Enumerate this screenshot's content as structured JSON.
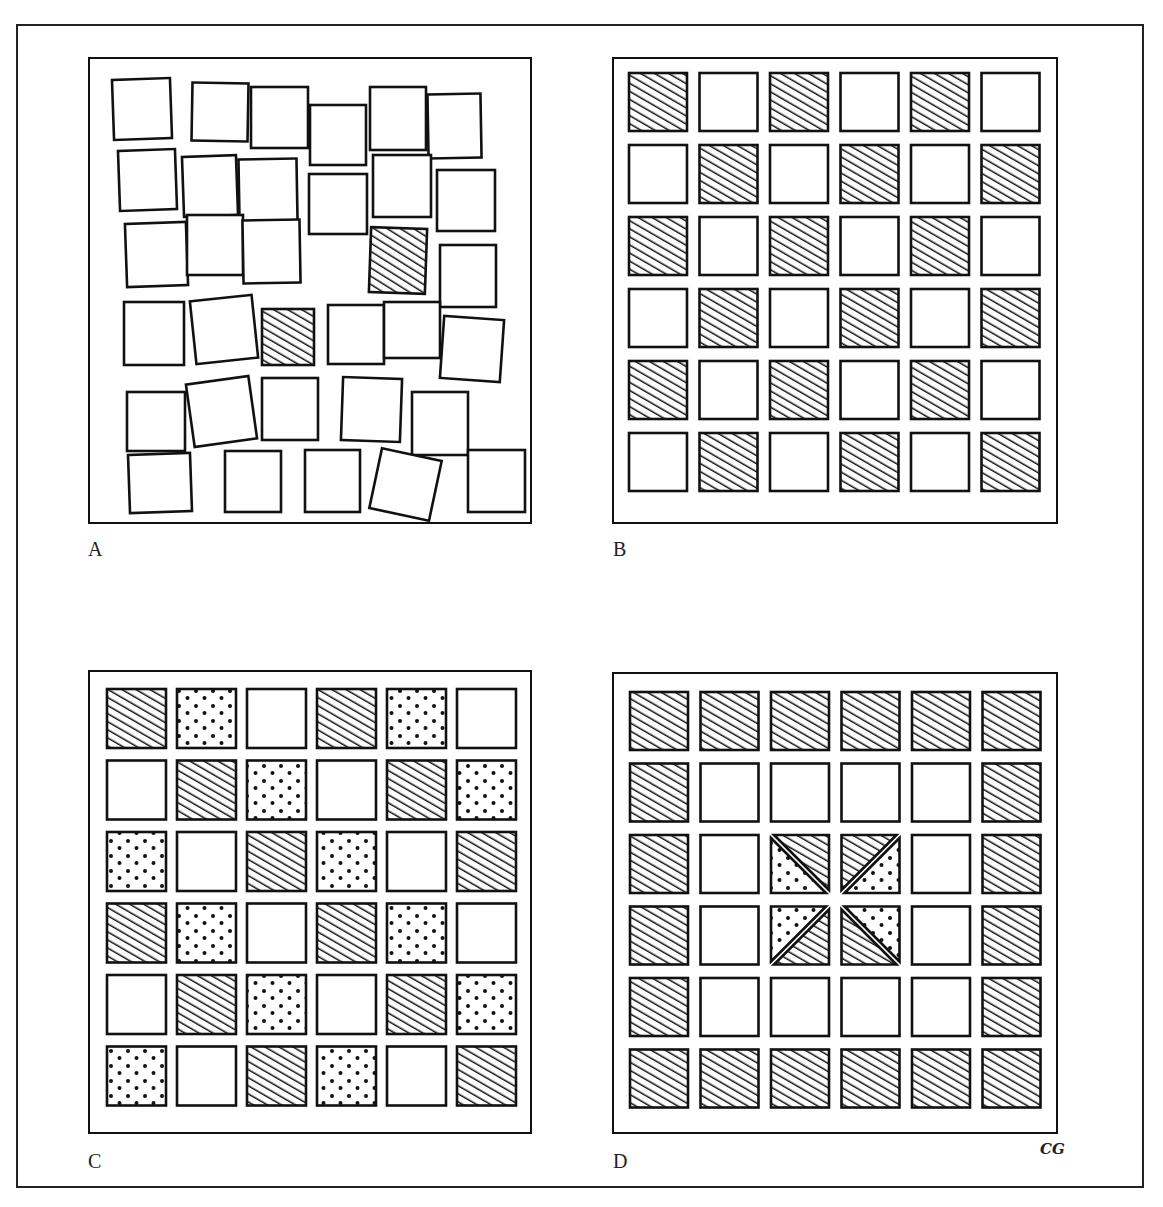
{
  "figure": {
    "panels": [
      {
        "id": "A",
        "label": "A",
        "description": "Irregular, overlapping, rotated squares; two hatched",
        "squares": [
          [
            111,
            77,
            58,
            60,
            -2,
            "plain"
          ],
          [
            190,
            81,
            56,
            58,
            1,
            "plain"
          ],
          [
            249,
            85,
            57,
            61,
            0,
            "plain"
          ],
          [
            308,
            103,
            56,
            60,
            0,
            "plain"
          ],
          [
            368,
            85,
            56,
            63,
            0,
            "plain"
          ],
          [
            426,
            92,
            53,
            64,
            -1,
            "plain"
          ],
          [
            117,
            148,
            57,
            60,
            -2,
            "plain"
          ],
          [
            181,
            154,
            54,
            60,
            -2,
            "plain"
          ],
          [
            237,
            157,
            58,
            62,
            -1,
            "plain"
          ],
          [
            307,
            172,
            58,
            60,
            0,
            "plain"
          ],
          [
            371,
            153,
            58,
            62,
            0,
            "plain"
          ],
          [
            435,
            168,
            58,
            61,
            0,
            "plain"
          ],
          [
            124,
            221,
            61,
            63,
            -2,
            "plain"
          ],
          [
            185,
            213,
            56,
            60,
            0,
            "plain"
          ],
          [
            241,
            218,
            57,
            63,
            -1,
            "plain"
          ],
          [
            368,
            226,
            56,
            65,
            2,
            "hatched"
          ],
          [
            438,
            243,
            56,
            62,
            0,
            "plain"
          ],
          [
            122,
            300,
            60,
            63,
            0,
            "plain"
          ],
          [
            191,
            296,
            62,
            63,
            -6,
            "plain"
          ],
          [
            260,
            307,
            52,
            56,
            0,
            "hatched"
          ],
          [
            326,
            303,
            56,
            59,
            0,
            "plain"
          ],
          [
            382,
            300,
            56,
            56,
            0,
            "plain"
          ],
          [
            440,
            316,
            60,
            62,
            4,
            "plain"
          ],
          [
            125,
            390,
            58,
            59,
            0,
            "plain"
          ],
          [
            188,
            378,
            63,
            63,
            -8,
            "plain"
          ],
          [
            260,
            376,
            56,
            62,
            0,
            "plain"
          ],
          [
            340,
            376,
            59,
            63,
            2,
            "plain"
          ],
          [
            410,
            390,
            56,
            63,
            0,
            "plain"
          ],
          [
            127,
            452,
            62,
            58,
            -2,
            "plain"
          ],
          [
            223,
            449,
            56,
            61,
            0,
            "plain"
          ],
          [
            303,
            448,
            55,
            62,
            0,
            "plain"
          ],
          [
            373,
            452,
            61,
            61,
            12,
            "plain"
          ],
          [
            466,
            448,
            57,
            62,
            0,
            "plain"
          ]
        ]
      },
      {
        "id": "B",
        "label": "B",
        "description": "6x6 regular grid, checkerboard of hatched and plain squares",
        "grid": [
          [
            "H",
            "P",
            "H",
            "P",
            "H",
            "P"
          ],
          [
            "P",
            "H",
            "P",
            "H",
            "P",
            "H"
          ],
          [
            "H",
            "P",
            "H",
            "P",
            "H",
            "P"
          ],
          [
            "P",
            "H",
            "P",
            "H",
            "P",
            "H"
          ],
          [
            "H",
            "P",
            "H",
            "P",
            "H",
            "P"
          ],
          [
            "P",
            "H",
            "P",
            "H",
            "P",
            "H"
          ]
        ]
      },
      {
        "id": "C",
        "label": "C",
        "description": "6x6 regular grid, diagonal repeating hatched / dotted / plain",
        "grid": [
          [
            "H",
            "D",
            "P",
            "H",
            "D",
            "P"
          ],
          [
            "P",
            "H",
            "D",
            "P",
            "H",
            "D"
          ],
          [
            "D",
            "P",
            "H",
            "D",
            "P",
            "H"
          ],
          [
            "H",
            "D",
            "P",
            "H",
            "D",
            "P"
          ],
          [
            "P",
            "H",
            "D",
            "P",
            "H",
            "D"
          ],
          [
            "D",
            "P",
            "H",
            "D",
            "P",
            "H"
          ]
        ]
      },
      {
        "id": "D",
        "label": "D",
        "description": "6x6 grid, hatched border, plain ring, center 2x2 split into diagonal hatched/dotted halves",
        "grid": [
          [
            "H",
            "H",
            "H",
            "H",
            "H",
            "H"
          ],
          [
            "H",
            "P",
            "P",
            "P",
            "P",
            "H"
          ],
          [
            "H",
            "P",
            "S1",
            "S2",
            "P",
            "H"
          ],
          [
            "H",
            "P",
            "S3",
            "S4",
            "P",
            "H"
          ],
          [
            "H",
            "P",
            "P",
            "P",
            "P",
            "H"
          ],
          [
            "H",
            "H",
            "H",
            "H",
            "H",
            "H"
          ]
        ]
      }
    ],
    "legend": {
      "H": "hatched",
      "D": "dotted",
      "P": "plain",
      "S1": "split: hatched upper-right, dotted lower-left (diagonal TL-BR)",
      "S2": "split: hatched upper-left, dotted lower-right (diagonal BL-TR)",
      "S3": "split: dotted upper-left, hatched lower-right (diagonal BL-TR)",
      "S4": "split: hatched lower-left, dotted upper-right (diagonal TL-BR)"
    },
    "signature": "CG",
    "colors": {
      "ink": "#111111",
      "paper": "#ffffff"
    }
  }
}
